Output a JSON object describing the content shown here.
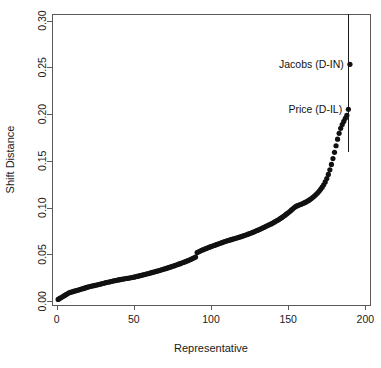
{
  "figure": {
    "width": 381,
    "height": 368,
    "background": "#ffffff",
    "point_color": "#111111",
    "axis_color": "#5a5a5a",
    "text_color": "#1a1a1a"
  },
  "chart_data": {
    "type": "scatter",
    "title": "",
    "xlabel": "Representative",
    "ylabel": "Shift Distance",
    "xlim": [
      -3,
      203
    ],
    "ylim": [
      -0.004,
      0.307
    ],
    "xticks": [
      0,
      50,
      100,
      150,
      200
    ],
    "xtick_labels": [
      "0",
      "50",
      "100",
      "150",
      "200"
    ],
    "yticks": [
      0.0,
      0.05,
      0.1,
      0.15,
      0.2,
      0.25,
      0.3
    ],
    "ytick_labels": [
      "0.00",
      "0.05",
      "0.10",
      "0.15",
      "0.20",
      "0.25",
      "0.30"
    ],
    "grid": false,
    "legend": false,
    "marker": "filled-circle",
    "marker_size": 2.6,
    "series": [
      {
        "name": "shift distance by representative rank",
        "x": [
          1,
          2,
          3,
          4,
          5,
          6,
          7,
          8,
          9,
          10,
          11,
          12,
          13,
          14,
          15,
          16,
          17,
          18,
          19,
          20,
          21,
          22,
          23,
          24,
          25,
          26,
          27,
          28,
          29,
          30,
          31,
          32,
          33,
          34,
          35,
          36,
          37,
          38,
          39,
          40,
          41,
          42,
          43,
          44,
          45,
          46,
          47,
          48,
          49,
          50,
          51,
          52,
          53,
          54,
          55,
          56,
          57,
          58,
          59,
          60,
          61,
          62,
          63,
          64,
          65,
          66,
          67,
          68,
          69,
          70,
          71,
          72,
          73,
          74,
          75,
          76,
          77,
          78,
          79,
          80,
          81,
          82,
          83,
          84,
          85,
          86,
          87,
          88,
          89,
          90,
          91,
          92,
          93,
          94,
          95,
          96,
          97,
          98,
          99,
          100,
          101,
          102,
          103,
          104,
          105,
          106,
          107,
          108,
          109,
          110,
          111,
          112,
          113,
          114,
          115,
          116,
          117,
          118,
          119,
          120,
          121,
          122,
          123,
          124,
          125,
          126,
          127,
          128,
          129,
          130,
          131,
          132,
          133,
          134,
          135,
          136,
          137,
          138,
          139,
          140,
          141,
          142,
          143,
          144,
          145,
          146,
          147,
          148,
          149,
          150,
          151,
          152,
          153,
          154,
          155,
          156,
          157,
          158,
          159,
          160,
          161,
          162,
          163,
          164,
          165,
          166,
          167,
          168,
          169,
          170,
          171,
          172,
          173,
          174,
          175,
          176,
          177,
          178,
          179,
          180,
          181,
          182,
          183,
          184,
          185,
          186,
          187,
          188,
          189,
          190
        ],
        "y": [
          0.002,
          0.003,
          0.004,
          0.005,
          0.006,
          0.007,
          0.008,
          0.009,
          0.0095,
          0.01,
          0.0105,
          0.011,
          0.0115,
          0.012,
          0.0125,
          0.013,
          0.0135,
          0.014,
          0.0145,
          0.015,
          0.0155,
          0.016,
          0.0163,
          0.0167,
          0.017,
          0.0174,
          0.0178,
          0.0182,
          0.0186,
          0.019,
          0.0195,
          0.02,
          0.0203,
          0.0206,
          0.021,
          0.0214,
          0.0218,
          0.0221,
          0.0224,
          0.0228,
          0.0231,
          0.0234,
          0.0237,
          0.024,
          0.0243,
          0.0246,
          0.0248,
          0.0251,
          0.0254,
          0.0257,
          0.0261,
          0.0265,
          0.0269,
          0.0273,
          0.0277,
          0.0281,
          0.0286,
          0.029,
          0.0294,
          0.0299,
          0.0303,
          0.0308,
          0.0312,
          0.0317,
          0.0321,
          0.0326,
          0.0331,
          0.0336,
          0.0341,
          0.0346,
          0.0351,
          0.0356,
          0.0362,
          0.0367,
          0.0373,
          0.0378,
          0.0384,
          0.039,
          0.0396,
          0.0402,
          0.0408,
          0.0414,
          0.042,
          0.0427,
          0.0434,
          0.0441,
          0.0448,
          0.0456,
          0.0464,
          0.0472,
          0.052,
          0.0528,
          0.0536,
          0.0544,
          0.0551,
          0.0558,
          0.0565,
          0.0572,
          0.0578,
          0.0584,
          0.059,
          0.0596,
          0.0602,
          0.0608,
          0.0614,
          0.062,
          0.0626,
          0.0632,
          0.0638,
          0.0643,
          0.0648,
          0.0653,
          0.0658,
          0.0663,
          0.0668,
          0.0673,
          0.0678,
          0.0683,
          0.0688,
          0.0693,
          0.0699,
          0.0705,
          0.0711,
          0.0717,
          0.0723,
          0.0729,
          0.0736,
          0.0743,
          0.075,
          0.0757,
          0.0764,
          0.0771,
          0.0779,
          0.0787,
          0.0795,
          0.0803,
          0.0811,
          0.0819,
          0.0827,
          0.0836,
          0.0845,
          0.0854,
          0.0864,
          0.0874,
          0.0885,
          0.0896,
          0.0908,
          0.092,
          0.0933,
          0.0946,
          0.0959,
          0.0973,
          0.0988,
          0.1002,
          0.1014,
          0.1022,
          0.1028,
          0.1034,
          0.1041,
          0.1048,
          0.1056,
          0.1065,
          0.1075,
          0.1086,
          0.1098,
          0.1111,
          0.1125,
          0.114,
          0.1157,
          0.1175,
          0.1196,
          0.1219,
          0.1245,
          0.1275,
          0.1312,
          0.1355,
          0.1405,
          0.1462,
          0.1525,
          0.1592,
          0.1662,
          0.1732,
          0.1795,
          0.1848,
          0.1888,
          0.1922,
          0.1955,
          0.1988,
          0.2052,
          0.2532
        ]
      }
    ],
    "vertical_line": {
      "x": 189,
      "y_start": 0.159,
      "y_end": 0.307
    },
    "annotations": [
      {
        "label": "Jacobs (D-IN)",
        "x": 190,
        "y": 0.2532,
        "text_anchor": "end",
        "text_x": 186,
        "text_y": 0.2532
      },
      {
        "label": "Price (D-IL)",
        "x": 189,
        "y": 0.2052,
        "text_anchor": "end",
        "text_x": 185,
        "text_y": 0.2052
      }
    ]
  }
}
